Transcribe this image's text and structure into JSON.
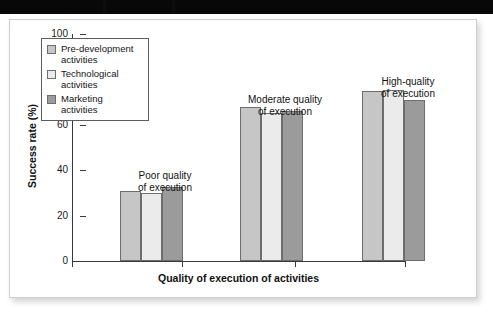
{
  "figure": {
    "kind": "scanned-figure-panel",
    "background_color": "#ffffff",
    "panel_border_color": "#cfcfcf",
    "scan_band_color": "#080808"
  },
  "axis": {
    "y_title": "Success rate (%)",
    "x_title": "Quality of execution of activities",
    "y_ticks": [
      "0",
      "20",
      "40",
      "60",
      "80",
      "100"
    ]
  },
  "legend": {
    "items": [
      {
        "label_line1": "Pre-development",
        "label_line2": "activities",
        "color": "#c6c6c6"
      },
      {
        "label_line1": "Technological",
        "label_line2": "activities",
        "color": "#ebebeb"
      },
      {
        "label_line1": "Marketing",
        "label_line2": "activities",
        "color": "#9b9b9b"
      }
    ]
  },
  "group_captions": [
    {
      "line1": "Poor quality",
      "line2": "of execution"
    },
    {
      "line1": "Moderate quality",
      "line2": "of execution"
    },
    {
      "line1": "High-quality",
      "line2": "of execution"
    }
  ],
  "chart_data": {
    "type": "bar",
    "title": "",
    "xlabel": "Quality of execution of activities",
    "ylabel": "Success rate (%)",
    "ylim": [
      0,
      100
    ],
    "yticks": [
      0,
      20,
      40,
      60,
      80,
      100
    ],
    "grid": false,
    "legend_position": "upper-left-inside",
    "categories": [
      "Poor quality of execution",
      "Moderate quality of execution",
      "High-quality of execution"
    ],
    "series": [
      {
        "name": "Pre-development activities",
        "color": "#c6c6c6",
        "values": [
          31,
          68,
          75
        ]
      },
      {
        "name": "Technological activities",
        "color": "#ebebeb",
        "values": [
          30,
          65,
          75.5
        ]
      },
      {
        "name": "Marketing activities",
        "color": "#9b9b9b",
        "values": [
          32.5,
          66,
          71
        ]
      }
    ]
  },
  "layout": {
    "group_left_px": [
      48,
      168,
      290
    ],
    "bar_width_px": 21,
    "plot_height_px": 227,
    "y_max": 100
  }
}
